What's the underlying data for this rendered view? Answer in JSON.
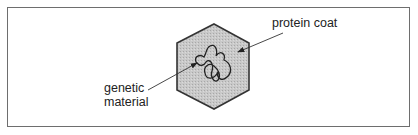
{
  "diagram": {
    "type": "virus-structure",
    "labels": {
      "protein_coat": "protein coat",
      "genetic_material_line1": "genetic",
      "genetic_material_line2": "material"
    },
    "colors": {
      "frame_border": "#6e6e6e",
      "hexagon_fill": "#c4c4c4",
      "hexagon_stroke": "#333333",
      "line_color": "#333333",
      "text_color": "#222222"
    }
  }
}
